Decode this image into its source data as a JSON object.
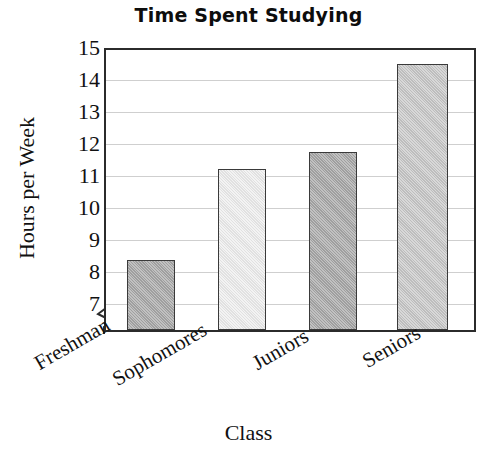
{
  "chart_data": {
    "type": "bar",
    "title": "Time Spent Studying",
    "xlabel": "Class",
    "ylabel": "Hours per Week",
    "categories": [
      "Freshman",
      "Sophomores",
      "Juniors",
      "Seniors"
    ],
    "values": [
      9.0,
      11.6,
      12.1,
      14.6
    ],
    "ylim": [
      7,
      15
    ],
    "y_ticks": [
      15,
      14,
      13,
      12,
      11,
      10,
      9,
      8,
      7
    ],
    "y_axis_broken": true,
    "grid": true,
    "legend": "none",
    "bar_colors": [
      "#a9a9a9",
      "#efefef",
      "#a9a9a9",
      "#c9c9c9"
    ],
    "bar_border_color": "#3a3a3a",
    "gridline_color": "#cfcfcf",
    "frame_color": "#2b2b2b",
    "series": [
      {
        "name": "Hours per Week",
        "points": [
          {
            "category": "Freshman",
            "value": 9.0
          },
          {
            "category": "Sophomores",
            "value": 11.6
          },
          {
            "category": "Juniors",
            "value": 12.1
          },
          {
            "category": "Seniors",
            "value": 14.6
          }
        ]
      }
    ]
  },
  "axis": {
    "y_tick_labels": [
      "15",
      "14",
      "13",
      "12",
      "11",
      "10",
      "9",
      "8",
      "7"
    ]
  }
}
